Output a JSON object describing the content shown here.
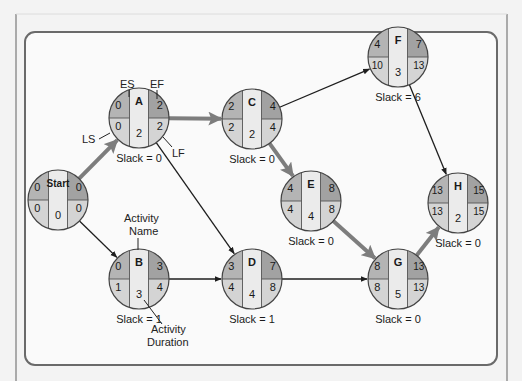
{
  "diagram": {
    "type": "activity-on-node network (critical path method)",
    "colors": {
      "background": "#f3f3f3",
      "panel": "#fafafa",
      "panel_border": "#6a6a6a",
      "early_start_cell": "#b4b4b4",
      "early_finish_cell": "#a2a2a2",
      "late_cell": "#d4d4d4",
      "name_column": "#ebebeb",
      "critical_arrow": "#7d7d7d",
      "normal_arrow": "#1e1e1e"
    },
    "legend_labels": {
      "es": "ES",
      "ef": "EF",
      "ls": "LS",
      "lf": "LF",
      "activity_name": [
        "Activity",
        "Name"
      ],
      "activity_duration": [
        "Activity",
        "Duration"
      ]
    },
    "nodes": [
      {
        "id": "Start",
        "name": "Start",
        "es": "0",
        "ef": "0",
        "ls": "0",
        "lf": "0",
        "duration": "0",
        "slack": "",
        "cx": 58,
        "cy": 200
      },
      {
        "id": "A",
        "name": "A",
        "es": "0",
        "ef": "2",
        "ls": "0",
        "lf": "2",
        "duration": "2",
        "slack": "Slack = 0",
        "cx": 139,
        "cy": 118
      },
      {
        "id": "B",
        "name": "B",
        "es": "0",
        "ef": "3",
        "ls": "1",
        "lf": "4",
        "duration": "3",
        "slack": "Slack = 1",
        "cx": 139,
        "cy": 279
      },
      {
        "id": "C",
        "name": "C",
        "es": "2",
        "ef": "4",
        "ls": "2",
        "lf": "4",
        "duration": "2",
        "slack": "Slack = 0",
        "cx": 252,
        "cy": 119
      },
      {
        "id": "D",
        "name": "D",
        "es": "3",
        "ef": "7",
        "ls": "4",
        "lf": "8",
        "duration": "4",
        "slack": "Slack = 1",
        "cx": 252,
        "cy": 279
      },
      {
        "id": "E",
        "name": "E",
        "es": "4",
        "ef": "8",
        "ls": "4",
        "lf": "8",
        "duration": "4",
        "slack": "Slack = 0",
        "cx": 311,
        "cy": 201
      },
      {
        "id": "F",
        "name": "F",
        "es": "4",
        "ef": "7",
        "ls": "10",
        "lf": "13",
        "duration": "3",
        "slack": "Slack = 6",
        "cx": 398,
        "cy": 57
      },
      {
        "id": "G",
        "name": "G",
        "es": "8",
        "ef": "13",
        "ls": "8",
        "lf": "13",
        "duration": "5",
        "slack": "Slack = 0",
        "cx": 398,
        "cy": 279
      },
      {
        "id": "H",
        "name": "H",
        "es": "13",
        "ef": "15",
        "ls": "13",
        "lf": "15",
        "duration": "2",
        "slack": "Slack = 0",
        "cx": 458,
        "cy": 203
      }
    ],
    "edges": [
      {
        "from": "Start",
        "to": "A",
        "critical": true
      },
      {
        "from": "Start",
        "to": "B",
        "critical": false
      },
      {
        "from": "A",
        "to": "C",
        "critical": true
      },
      {
        "from": "A",
        "to": "D",
        "critical": false
      },
      {
        "from": "B",
        "to": "D",
        "critical": false
      },
      {
        "from": "C",
        "to": "F",
        "critical": false
      },
      {
        "from": "C",
        "to": "E",
        "critical": true
      },
      {
        "from": "D",
        "to": "G",
        "critical": false
      },
      {
        "from": "E",
        "to": "G",
        "critical": true
      },
      {
        "from": "F",
        "to": "H",
        "critical": false
      },
      {
        "from": "G",
        "to": "H",
        "critical": true
      }
    ]
  }
}
